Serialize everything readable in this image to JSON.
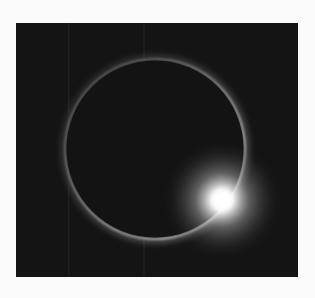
{
  "image": {
    "subject": "Total solar eclipse – diamond ring effect",
    "alt": "Black background with a thin glowing ring of the sun's corona around the moon, with a bright flare at the lower right",
    "colors": {
      "page_background": "#fbfbfb",
      "sky": "#141414",
      "ring": "#d8d8d8",
      "flare": "#ffffff"
    }
  }
}
